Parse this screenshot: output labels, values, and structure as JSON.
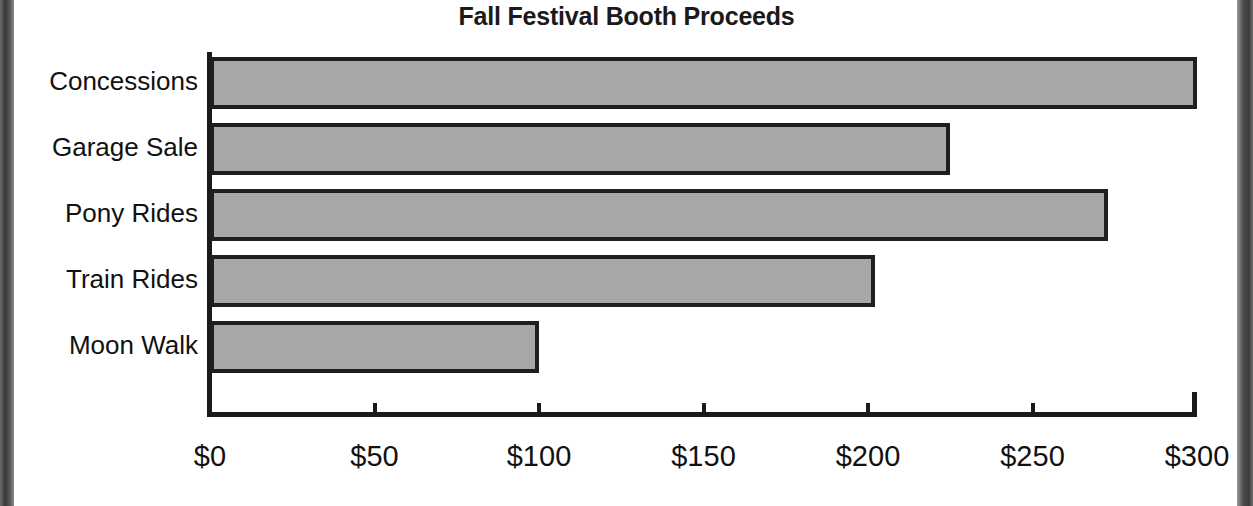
{
  "chart_data": {
    "type": "bar",
    "orientation": "horizontal",
    "title": "Fall Festival Booth Proceeds",
    "xlabel": "",
    "ylabel": "",
    "categories": [
      "Concessions",
      "Garage Sale",
      "Pony Rides",
      "Train Rides",
      "Moon Walk"
    ],
    "values": [
      300,
      225,
      273,
      202,
      100
    ],
    "xlim": [
      0,
      300
    ],
    "xticks": [
      0,
      50,
      100,
      150,
      200,
      250,
      300
    ],
    "xtick_labels": [
      "$0",
      "$50",
      "$100",
      "$150",
      "$200",
      "$250",
      "$300"
    ],
    "grid": false,
    "legend": null,
    "currency": "USD",
    "bar_fill_color": "#a8a8a8",
    "bar_border_color": "#1f1f1f",
    "axis_color": "#1a1a1a",
    "background_color": "#ffffff"
  }
}
